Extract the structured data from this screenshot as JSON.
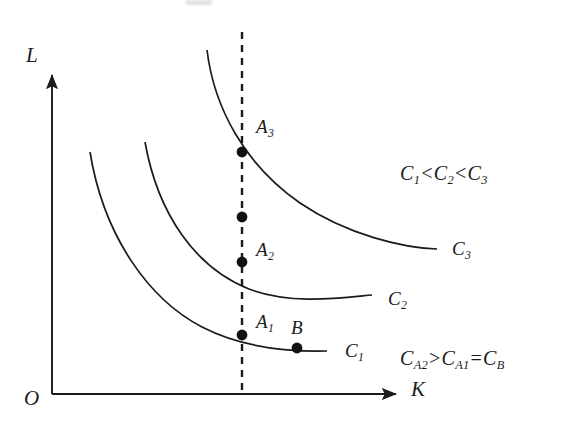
{
  "figure": {
    "background_color": "#ffffff",
    "line_color": "#1b1b1b",
    "width": 562,
    "height": 439
  },
  "axes": {
    "y_label": "L",
    "x_label": "K",
    "origin_label": "O",
    "origin_px": {
      "x": 52,
      "y": 394
    },
    "y_axis_top_px": {
      "x": 52,
      "y": 73
    },
    "x_axis_right_px": {
      "x": 399,
      "y": 394
    }
  },
  "curves": [
    {
      "id": "C1",
      "label": "C",
      "subscript": "1",
      "label_px": {
        "x": 345,
        "y": 341
      },
      "path": "M 90,152 C 104,238 150,300 202,327 C 243,348 288,352 327,351",
      "start_px": {
        "x": 90,
        "y": 152
      },
      "end_px": {
        "x": 327,
        "y": 351
      }
    },
    {
      "id": "C2",
      "label": "C",
      "subscript": "2",
      "label_px": {
        "x": 388,
        "y": 290
      },
      "path": "M 145,142 C 158,215 196,268 249,289 C 291,305 340,298 372,295",
      "start_px": {
        "x": 145,
        "y": 142
      },
      "end_px": {
        "x": 372,
        "y": 295
      }
    },
    {
      "id": "C3",
      "label": "C",
      "subscript": "3",
      "label_px": {
        "x": 452,
        "y": 240
      },
      "path": "M 207,50 C 214,108 245,165 300,203 C 347,235 404,248 437,249",
      "start_px": {
        "x": 207,
        "y": 50
      },
      "end_px": {
        "x": 437,
        "y": 249
      }
    }
  ],
  "dashed_line": {
    "name": "vertical-capital-line",
    "x_px": 242,
    "top_px": 32,
    "bottom_px": 394,
    "dash_pattern": "7,6"
  },
  "points": [
    {
      "id": "A3",
      "label": "A",
      "subscript": "3",
      "x": 242,
      "y": 152,
      "label_px": {
        "x": 256,
        "y": 117
      },
      "labeled": true
    },
    {
      "id": "unlabeled",
      "label": "",
      "subscript": "",
      "x": 242,
      "y": 217,
      "labeled": false
    },
    {
      "id": "A2",
      "label": "A",
      "subscript": "2",
      "x": 242,
      "y": 262,
      "label_px": {
        "x": 256,
        "y": 240
      },
      "labeled": true
    },
    {
      "id": "A1",
      "label": "A",
      "subscript": "1",
      "x": 242,
      "y": 335,
      "label_px": {
        "x": 256,
        "y": 312
      },
      "labeled": true
    },
    {
      "id": "B",
      "label": "B",
      "subscript": "",
      "x": 297,
      "y": 348,
      "label_px": {
        "x": 292,
        "y": 318
      },
      "labeled": true
    }
  ],
  "annotations": {
    "cost_ordering": {
      "parts": [
        "C",
        "1",
        "<",
        "C",
        "2",
        "<",
        "C",
        "3"
      ],
      "text": "C1<C2<C3",
      "px": {
        "x": 400,
        "y": 163
      }
    },
    "point_cost_relation": {
      "parts": [
        "C",
        "A2",
        ">",
        "C",
        "A1",
        "=",
        "C",
        "B"
      ],
      "text": "CA2>CA1=CB",
      "px": {
        "x": 400,
        "y": 348
      }
    }
  }
}
